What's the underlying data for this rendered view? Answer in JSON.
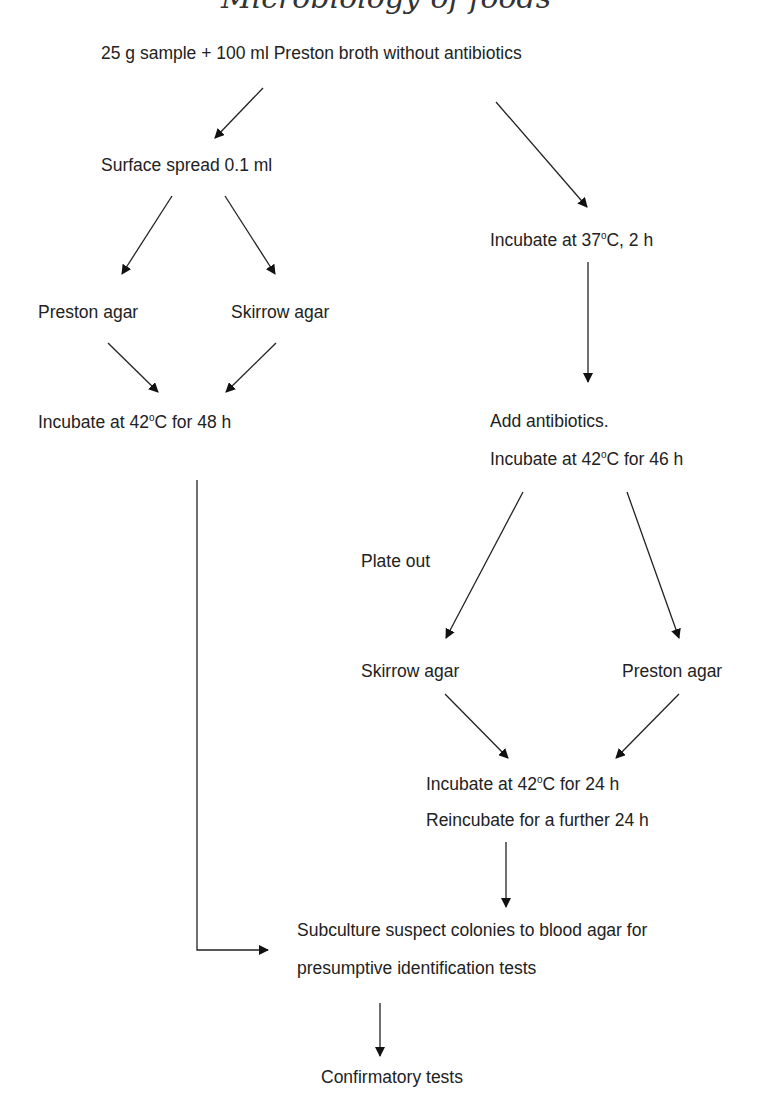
{
  "header_cropped": "Microbiology of foods",
  "nodes": {
    "start": "25 g sample + 100 ml Preston broth without antibiotics",
    "surface_spread": "Surface spread 0.1 ml",
    "preston_agar_1": "Preston agar",
    "skirrow_agar_1": "Skirrow agar",
    "incubate_42_48_a": "Incubate at 42",
    "incubate_42_48_b": "C for 48 h",
    "incubate_37_a": "Incubate at 37",
    "incubate_37_b": "C, 2 h",
    "add_antibiotics": "Add antibiotics.",
    "incubate_42_46_a": "Incubate at 42",
    "incubate_42_46_b": "C for 46 h",
    "plate_out": "Plate out",
    "skirrow_agar_2": "Skirrow agar",
    "preston_agar_2": "Preston agar",
    "incubate_42_24_a": "Incubate at 42",
    "incubate_42_24_b": "C for 24 h",
    "reincubate": "Reincubate for a further 24 h",
    "subculture_1": "Subculture suspect colonies to blood agar for",
    "subculture_2": "presumptive identification tests",
    "confirmatory": "Confirmatory tests"
  },
  "degree_symbol": "o",
  "colors": {
    "text": "#222222",
    "line": "#222222",
    "background": "#ffffff"
  }
}
